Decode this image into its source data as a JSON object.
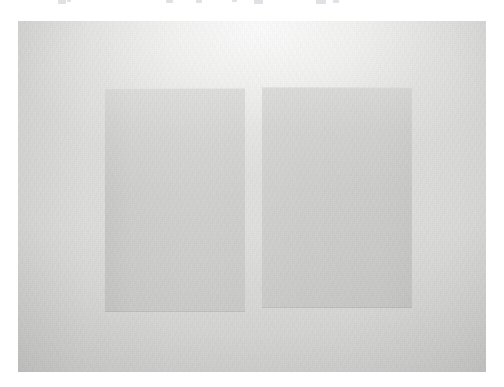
{
  "page": {
    "width": 504,
    "height": 387,
    "background_color": "#ffffff",
    "kind": "photograph"
  },
  "text_remnants": {
    "description": "faint cut-off descenders of a text line above the crop boundary",
    "marks": [
      {
        "x": 58,
        "width": 8,
        "height": 4
      },
      {
        "x": 66,
        "width": 4,
        "height": 2
      },
      {
        "x": 166,
        "width": 7,
        "height": 3
      },
      {
        "x": 196,
        "width": 6,
        "height": 3
      },
      {
        "x": 232,
        "width": 5,
        "height": 2
      },
      {
        "x": 254,
        "width": 9,
        "height": 4
      },
      {
        "x": 316,
        "width": 10,
        "height": 4
      },
      {
        "x": 332,
        "width": 6,
        "height": 3
      }
    ]
  },
  "photo": {
    "name": "two-grey-sheets-photograph",
    "frame": {
      "x": 18,
      "y": 21,
      "width": 468,
      "height": 351
    },
    "surface": {
      "label": "background paper surface",
      "base_color": "#e1e1df",
      "highlight_color": "#f3f3f1",
      "shadow_color": "#c8c8c6",
      "highlight_position": "top-center",
      "shadow_position": "bottom-left and bottom-right corners"
    },
    "subjects": [
      {
        "name": "sheet-left",
        "label": "left grey rectangle",
        "fill_color": "#d0d0ce",
        "rect": {
          "x": 105,
          "y": 88,
          "width": 140,
          "height": 224
        },
        "orientation": "portrait"
      },
      {
        "name": "sheet-right",
        "label": "right grey rectangle",
        "fill_color": "#d0d0ce",
        "rect": {
          "x": 262,
          "y": 87,
          "width": 150,
          "height": 221
        },
        "orientation": "portrait"
      }
    ],
    "gap": {
      "label": "vertical light gap between the two sheets",
      "x": 245,
      "width": 17,
      "color": "#ebebe9"
    }
  }
}
